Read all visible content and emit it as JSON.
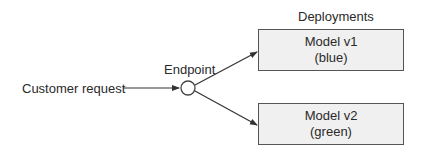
{
  "diagram": {
    "source_label": "Customer request",
    "endpoint_label": "Endpoint",
    "group_label": "Deployments",
    "deployments": [
      {
        "name": "Model v1",
        "variant": "(blue)"
      },
      {
        "name": "Model v2",
        "variant": "(green)"
      }
    ],
    "colors": {
      "stroke": "#333333",
      "box_fill": "#f0f0f0",
      "box_border": "#555555"
    }
  }
}
